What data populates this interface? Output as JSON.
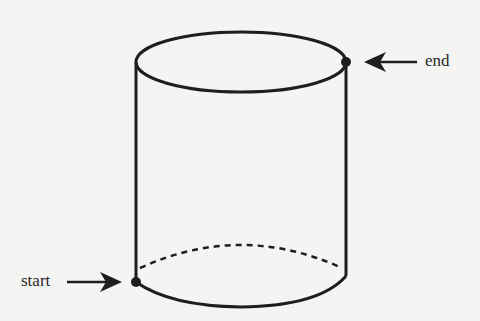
{
  "diagram": {
    "type": "cylinder-path",
    "labels": {
      "start": "start",
      "end": "end"
    },
    "colors": {
      "background": "#f4f4f2",
      "stroke": "#1e1e1e",
      "text": "#2a2a2a"
    }
  }
}
